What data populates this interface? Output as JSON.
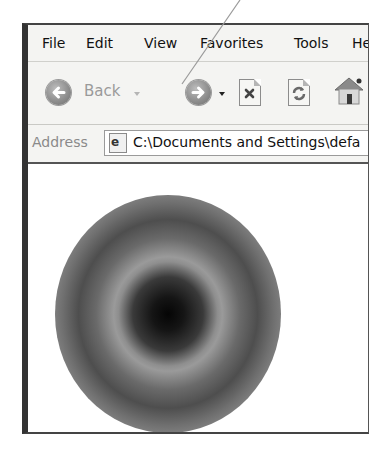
{
  "menubar": {
    "items": [
      {
        "label": "File"
      },
      {
        "label": "Edit"
      },
      {
        "label": "View"
      },
      {
        "label": "Favorites"
      },
      {
        "label": "Tools"
      },
      {
        "label": "He"
      }
    ]
  },
  "toolbar": {
    "back_label": "Back",
    "icons": {
      "back": "back-arrow-icon",
      "forward": "forward-arrow-icon",
      "stop": "stop-icon",
      "refresh": "refresh-icon",
      "home": "home-icon"
    }
  },
  "addressbar": {
    "label": "Address",
    "value": "C:\\Documents and Settings\\defa"
  },
  "content": {
    "image": "concentric-gray-rings"
  },
  "colors": {
    "window_bg": "#f4f4f2",
    "content_bg": "#ffffff",
    "frame": "#333333"
  }
}
